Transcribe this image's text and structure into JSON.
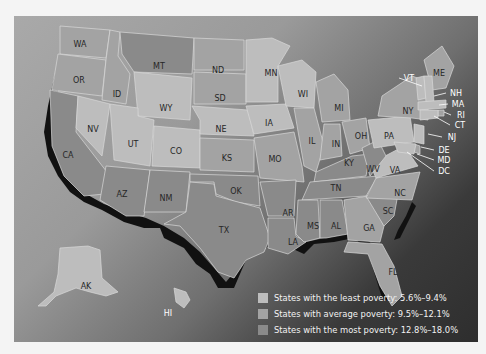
{
  "map": {
    "title": "",
    "category_colors": {
      "least": "#bdbdbd",
      "average": "#a3a3a3",
      "most": "#8a8a8a"
    },
    "states": [
      {
        "abbr": "WA",
        "x": 66,
        "y": 28,
        "cat": "average"
      },
      {
        "abbr": "OR",
        "x": 65,
        "y": 64,
        "cat": "average"
      },
      {
        "abbr": "CA",
        "x": 54,
        "y": 139,
        "cat": "most"
      },
      {
        "abbr": "NV",
        "x": 79,
        "y": 113,
        "cat": "least"
      },
      {
        "abbr": "ID",
        "x": 103,
        "y": 78,
        "cat": "average"
      },
      {
        "abbr": "MT",
        "x": 145,
        "y": 50,
        "cat": "most"
      },
      {
        "abbr": "WY",
        "x": 152,
        "y": 92,
        "cat": "least"
      },
      {
        "abbr": "UT",
        "x": 119,
        "y": 128,
        "cat": "least"
      },
      {
        "abbr": "CO",
        "x": 162,
        "y": 135,
        "cat": "least"
      },
      {
        "abbr": "AZ",
        "x": 108,
        "y": 178,
        "cat": "most"
      },
      {
        "abbr": "NM",
        "x": 152,
        "y": 182,
        "cat": "most"
      },
      {
        "abbr": "ND",
        "x": 204,
        "y": 54,
        "cat": "average"
      },
      {
        "abbr": "SD",
        "x": 206,
        "y": 82,
        "cat": "average"
      },
      {
        "abbr": "NE",
        "x": 207,
        "y": 113,
        "cat": "least"
      },
      {
        "abbr": "KS",
        "x": 213,
        "y": 142,
        "cat": "average"
      },
      {
        "abbr": "OK",
        "x": 222,
        "y": 175,
        "cat": "most"
      },
      {
        "abbr": "TX",
        "x": 210,
        "y": 214,
        "cat": "most"
      },
      {
        "abbr": "MN",
        "x": 257,
        "y": 57,
        "cat": "least"
      },
      {
        "abbr": "IA",
        "x": 255,
        "y": 107,
        "cat": "least"
      },
      {
        "abbr": "MO",
        "x": 261,
        "y": 143,
        "cat": "average"
      },
      {
        "abbr": "AR",
        "x": 274,
        "y": 197,
        "cat": "most"
      },
      {
        "abbr": "LA",
        "x": 279,
        "y": 226,
        "cat": "most"
      },
      {
        "abbr": "WI",
        "x": 289,
        "y": 78,
        "cat": "least"
      },
      {
        "abbr": "IL",
        "x": 298,
        "y": 125,
        "cat": "average"
      },
      {
        "abbr": "MI",
        "x": 325,
        "y": 92,
        "cat": "average"
      },
      {
        "abbr": "IN",
        "x": 322,
        "y": 128,
        "cat": "average"
      },
      {
        "abbr": "OH",
        "x": 347,
        "y": 120,
        "cat": "average"
      },
      {
        "abbr": "KY",
        "x": 335,
        "y": 147,
        "cat": "most"
      },
      {
        "abbr": "TN",
        "x": 322,
        "y": 172,
        "cat": "most"
      },
      {
        "abbr": "MS",
        "x": 299,
        "y": 210,
        "cat": "most"
      },
      {
        "abbr": "AL",
        "x": 322,
        "y": 210,
        "cat": "most"
      },
      {
        "abbr": "GA",
        "x": 355,
        "y": 212,
        "cat": "average"
      },
      {
        "abbr": "FL",
        "x": 379,
        "y": 256,
        "cat": "average"
      },
      {
        "abbr": "SC",
        "x": 374,
        "y": 195,
        "cat": "most"
      },
      {
        "abbr": "NC",
        "x": 386,
        "y": 177,
        "cat": "average"
      },
      {
        "abbr": "VA",
        "x": 381,
        "y": 154,
        "cat": "least"
      },
      {
        "abbr": "WV",
        "x": 359,
        "y": 153,
        "cat": "most"
      },
      {
        "abbr": "PA",
        "x": 375,
        "y": 120,
        "cat": "least"
      },
      {
        "abbr": "NY",
        "x": 394,
        "y": 95,
        "cat": "average"
      },
      {
        "abbr": "ME",
        "x": 425,
        "y": 57,
        "cat": "average"
      },
      {
        "abbr": "AK",
        "x": 72,
        "y": 270,
        "cat": "least"
      },
      {
        "abbr": "HI",
        "x": 154,
        "y": 297,
        "cat": "least"
      }
    ],
    "callouts": [
      {
        "abbr": "VT",
        "label_x": 393,
        "label_y": 62,
        "tx": 408,
        "ty": 70
      },
      {
        "abbr": "NH",
        "label_x": 440,
        "label_y": 77,
        "tx": 420,
        "ty": 80
      },
      {
        "abbr": "MA",
        "label_x": 442,
        "label_y": 88,
        "tx": 425,
        "ty": 89
      },
      {
        "abbr": "RI",
        "label_x": 445,
        "label_y": 99,
        "tx": 430,
        "ty": 96
      },
      {
        "abbr": "CT",
        "label_x": 444,
        "label_y": 109,
        "tx": 420,
        "ty": 100
      },
      {
        "abbr": "NJ",
        "label_x": 436,
        "label_y": 121,
        "tx": 414,
        "ty": 118
      },
      {
        "abbr": "DE",
        "label_x": 428,
        "label_y": 134,
        "tx": 407,
        "ty": 131
      },
      {
        "abbr": "MD",
        "label_x": 428,
        "label_y": 144,
        "tx": 403,
        "ty": 138
      },
      {
        "abbr": "DC",
        "label_x": 428,
        "label_y": 155,
        "tx": 393,
        "ty": 136
      }
    ]
  },
  "legend": {
    "items": [
      {
        "label": "States with the least poverty: 5.6%–9.4%",
        "color": "#bdbdbd"
      },
      {
        "label": "States with average poverty: 9.5%–12.1%",
        "color": "#a3a3a3"
      },
      {
        "label": "States with the most poverty: 12.8%–18.0%",
        "color": "#8a8a8a"
      }
    ]
  }
}
